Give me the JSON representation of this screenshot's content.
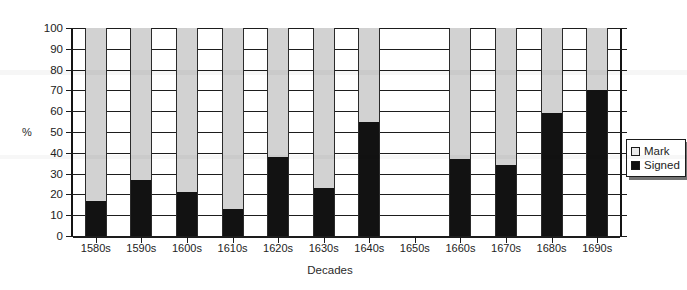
{
  "chart_data": {
    "type": "bar",
    "subtype": "stacked-100-percent",
    "title": "",
    "xlabel": "Decades",
    "ylabel": "%",
    "ylim": [
      0,
      100
    ],
    "ytick_step": 10,
    "yticks": [
      0,
      10,
      20,
      30,
      40,
      50,
      60,
      70,
      80,
      90,
      100
    ],
    "grid": true,
    "legend_position": "right",
    "categories": [
      "1580s",
      "1590s",
      "1600s",
      "1610s",
      "1620s",
      "1630s",
      "1640s",
      "1650s",
      "1660s",
      "1670s",
      "1680s",
      "1690s"
    ],
    "series": [
      {
        "name": "Signed",
        "color": "#121212",
        "values": [
          17,
          27,
          21,
          13,
          38,
          23,
          55,
          null,
          37,
          34,
          59,
          70
        ]
      },
      {
        "name": "Mark",
        "color": "#d2d2d2",
        "values": [
          83,
          73,
          79,
          87,
          62,
          77,
          45,
          null,
          63,
          66,
          41,
          30
        ]
      }
    ]
  },
  "legend": {
    "items": [
      {
        "label": "Mark",
        "swatch": "mark"
      },
      {
        "label": "Signed",
        "swatch": "signed"
      }
    ]
  },
  "colors": {
    "mark": "#d2d2d2",
    "signed": "#121212",
    "axis": "#1b1b1b",
    "background": "#ffffff"
  }
}
